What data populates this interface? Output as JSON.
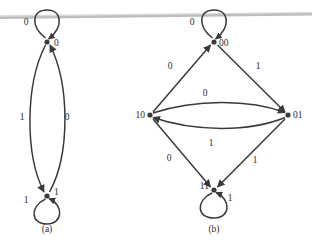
{
  "figure": {
    "background_color": "#ffffff",
    "ink_color": "#3a3a3a",
    "text_color": "#2b2b2b",
    "scan_line_color": "#b9b9b9",
    "diagrams": [
      {
        "id": "a",
        "caption": "(a)",
        "nodes": [
          {
            "id": "n0",
            "label": "0",
            "cx": 47,
            "cy": 42,
            "label_dx": 7,
            "label_dy": 4
          },
          {
            "id": "n1",
            "label": "1",
            "cx": 47,
            "cy": 196,
            "label_dx": 7,
            "label_dy": -1
          }
        ],
        "self_loops": [
          {
            "node": "n0",
            "label": "0",
            "label_x": 26,
            "label_y": 25
          },
          {
            "node": "n1",
            "label": "1",
            "label_x": 26,
            "label_y": 203
          }
        ],
        "edges": [
          {
            "from": "n0",
            "to": "n1",
            "label": "1",
            "label_x": 22,
            "label_y": 120
          },
          {
            "from": "n1",
            "to": "n0",
            "label": "0",
            "label_x": 67,
            "label_y": 120
          }
        ]
      },
      {
        "id": "b",
        "caption": "(b)",
        "nodes": [
          {
            "id": "n00",
            "label": "00",
            "cx": 214,
            "cy": 42,
            "label_dx": 5,
            "label_dy": 4
          },
          {
            "id": "n10",
            "label": "10",
            "cx": 150,
            "cy": 115,
            "label_dx": -18,
            "label_dy": 3
          },
          {
            "id": "n01",
            "label": "01",
            "cx": 288,
            "cy": 115,
            "label_dx": 5,
            "label_dy": 3
          },
          {
            "id": "n11",
            "label": "11",
            "cx": 214,
            "cy": 190,
            "label_dx": -18,
            "label_dy": -1
          }
        ],
        "self_loops": [
          {
            "node": "n00",
            "label": "0",
            "label_x": 192,
            "label_y": 25
          },
          {
            "node": "n11",
            "label": "1",
            "label_x": 228,
            "label_y": 200
          }
        ],
        "edges": [
          {
            "from": "n10",
            "to": "n00",
            "label": "0",
            "label_x": 170,
            "label_y": 69
          },
          {
            "from": "n00",
            "to": "n01",
            "label": "1",
            "label_x": 258,
            "label_y": 69
          },
          {
            "from": "n10",
            "to": "n01",
            "label": "0",
            "label_x": 205,
            "label_y": 96
          },
          {
            "from": "n01",
            "to": "n10",
            "label": "1",
            "label_x": 211,
            "label_y": 145
          },
          {
            "from": "n10",
            "to": "n11",
            "label": "0",
            "label_x": 169,
            "label_y": 161
          },
          {
            "from": "n01",
            "to": "n11",
            "label": "1",
            "label_x": 255,
            "label_y": 163
          }
        ]
      }
    ],
    "captions": [
      {
        "text": "(a)",
        "x": 47,
        "y": 232
      },
      {
        "text": "(b)",
        "x": 214,
        "y": 232
      }
    ]
  }
}
